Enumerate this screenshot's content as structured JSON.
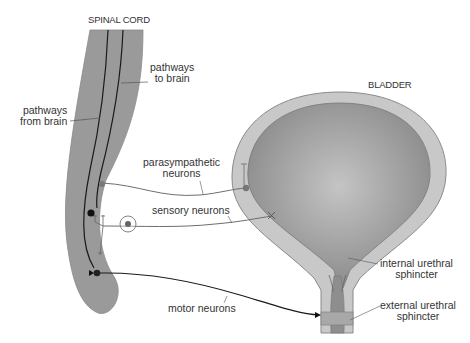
{
  "diagram": {
    "title_spinal": "SPINAL CORD",
    "title_bladder": "BLADDER",
    "labels": {
      "pathways_from_brain_1": "pathways",
      "pathways_from_brain_2": "from brain",
      "pathways_to_brain_1": "pathways",
      "pathways_to_brain_2": "to brain",
      "parasympathetic_1": "parasympathetic",
      "parasympathetic_2": "neurons",
      "sensory": "sensory neurons",
      "motor": "motor neurons",
      "internal_1": "internal urethral",
      "internal_2": "sphincter",
      "external_1": "external urethral",
      "external_2": "sphincter"
    },
    "colors": {
      "cord_fill": "#9a9a9a",
      "bladder_wall": "#c8c8c8",
      "bladder_lumen": "#8e8e8e",
      "bladder_highlight": "#bdbdbd",
      "nerve_dark": "#1a1a1a",
      "nerve_gray": "#6e6e6e",
      "text": "#333333"
    }
  }
}
